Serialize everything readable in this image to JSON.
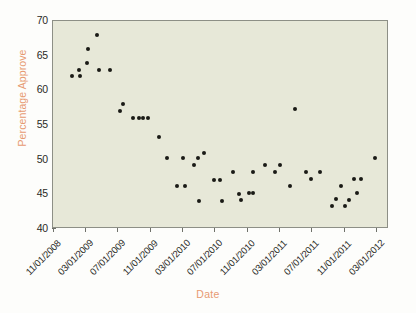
{
  "chart_data": {
    "type": "scatter",
    "title": "",
    "xlabel": "Date",
    "ylabel": "Percentage Approve",
    "ylim": [
      40,
      70
    ],
    "ytick_labels": [
      "70",
      "65",
      "60",
      "55",
      "50",
      "45",
      "40"
    ],
    "ytick_values": [
      70,
      65,
      60,
      55,
      50,
      45,
      40
    ],
    "xtick_labels": [
      "11/01/2008",
      "03/01/2009",
      "07/01/2009",
      "11/01/2009",
      "03/01/2010",
      "07/01/2010",
      "11/01/2010",
      "03/01/2011",
      "07/01/2011",
      "11/01/2011",
      "03/01/2012"
    ],
    "xtick_values": [
      0,
      4,
      8,
      12,
      16,
      20,
      24,
      28,
      32,
      36,
      40
    ],
    "xlim": [
      -0.1,
      41.5
    ],
    "grid": false,
    "legend": null,
    "marker": "filled-circle",
    "marker_color": "#1a1a16",
    "plot_background": "#e7e8d8",
    "axis_label_color": "#e79a72",
    "points": [
      {
        "x": 2.2,
        "y": 62.0
      },
      {
        "x": 3.1,
        "y": 63.0
      },
      {
        "x": 3.2,
        "y": 62.0
      },
      {
        "x": 4.1,
        "y": 64.0
      },
      {
        "x": 4.2,
        "y": 66.0
      },
      {
        "x": 5.3,
        "y": 68.0
      },
      {
        "x": 5.6,
        "y": 63.0
      },
      {
        "x": 6.9,
        "y": 63.0
      },
      {
        "x": 8.2,
        "y": 57.0
      },
      {
        "x": 8.6,
        "y": 58.0
      },
      {
        "x": 9.8,
        "y": 56.0
      },
      {
        "x": 10.6,
        "y": 56.0
      },
      {
        "x": 11.1,
        "y": 56.0
      },
      {
        "x": 11.6,
        "y": 56.0
      },
      {
        "x": 13.0,
        "y": 53.2
      },
      {
        "x": 14.0,
        "y": 50.2
      },
      {
        "x": 15.2,
        "y": 46.2
      },
      {
        "x": 16.0,
        "y": 50.2
      },
      {
        "x": 16.2,
        "y": 46.2
      },
      {
        "x": 17.4,
        "y": 49.2
      },
      {
        "x": 17.8,
        "y": 50.2
      },
      {
        "x": 18.0,
        "y": 44.1
      },
      {
        "x": 18.6,
        "y": 51.0
      },
      {
        "x": 19.8,
        "y": 47.1
      },
      {
        "x": 20.6,
        "y": 47.1
      },
      {
        "x": 20.8,
        "y": 44.1
      },
      {
        "x": 22.2,
        "y": 48.2
      },
      {
        "x": 22.9,
        "y": 45.1
      },
      {
        "x": 23.2,
        "y": 44.2
      },
      {
        "x": 24.2,
        "y": 45.2
      },
      {
        "x": 24.6,
        "y": 45.2
      },
      {
        "x": 24.7,
        "y": 48.2
      },
      {
        "x": 26.2,
        "y": 49.2
      },
      {
        "x": 27.4,
        "y": 48.2
      },
      {
        "x": 28.0,
        "y": 49.2
      },
      {
        "x": 29.3,
        "y": 46.2
      },
      {
        "x": 29.9,
        "y": 57.3
      },
      {
        "x": 31.2,
        "y": 48.2
      },
      {
        "x": 31.9,
        "y": 47.2
      },
      {
        "x": 33.0,
        "y": 48.2
      },
      {
        "x": 34.4,
        "y": 43.3
      },
      {
        "x": 34.9,
        "y": 44.3
      },
      {
        "x": 35.6,
        "y": 46.2
      },
      {
        "x": 36.0,
        "y": 43.3
      },
      {
        "x": 36.6,
        "y": 44.2
      },
      {
        "x": 37.2,
        "y": 47.2
      },
      {
        "x": 37.5,
        "y": 45.2
      },
      {
        "x": 38.0,
        "y": 47.2
      },
      {
        "x": 39.8,
        "y": 50.3
      }
    ]
  }
}
